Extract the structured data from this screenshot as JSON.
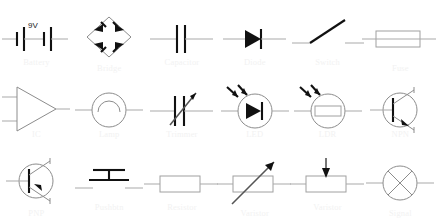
{
  "chart": {
    "type": "reference-grid",
    "columns": 6,
    "rows": 3,
    "label_color": "#f2f2f2",
    "symbol_color": "#111111",
    "lead_color": "#a9a9a9",
    "background": "#ffffff"
  },
  "symbols": [
    {
      "id": "battery",
      "label": "Battery",
      "value": "9V",
      "row": 1,
      "col": 1
    },
    {
      "id": "bridge",
      "label": "Bridge",
      "value": "",
      "row": 1,
      "col": 2
    },
    {
      "id": "capacitor",
      "label": "Capacitor",
      "value": "",
      "row": 1,
      "col": 3
    },
    {
      "id": "diode",
      "label": "Diode",
      "value": "",
      "row": 1,
      "col": 4
    },
    {
      "id": "switch",
      "label": "Switch",
      "value": "",
      "row": 1,
      "col": 5
    },
    {
      "id": "fuse",
      "label": "Fuse",
      "value": "",
      "row": 1,
      "col": 6
    },
    {
      "id": "ic",
      "label": "IC",
      "value": "",
      "row": 2,
      "col": 1
    },
    {
      "id": "lamp",
      "label": "Lamp",
      "value": "",
      "row": 2,
      "col": 2
    },
    {
      "id": "trimmer",
      "label": "Trimmer",
      "value": "",
      "row": 2,
      "col": 3
    },
    {
      "id": "led",
      "label": "LED",
      "value": "",
      "row": 2,
      "col": 4
    },
    {
      "id": "ldr",
      "label": "LDR",
      "value": "",
      "row": 2,
      "col": 5
    },
    {
      "id": "npn",
      "label": "NPN",
      "value": "",
      "row": 2,
      "col": 6
    },
    {
      "id": "pnp",
      "label": "PNP",
      "value": "",
      "row": 3,
      "col": 1
    },
    {
      "id": "pushbutton",
      "label": "Pushbtn",
      "value": "",
      "row": 3,
      "col": 2
    },
    {
      "id": "resistor",
      "label": "Resistor",
      "value": "",
      "row": 3,
      "col": 3
    },
    {
      "id": "varistor",
      "label": "Varistor",
      "value": "",
      "row": 3,
      "col": 4
    },
    {
      "id": "varistor2",
      "label": "Varistor",
      "value": "",
      "row": 3,
      "col": 5
    },
    {
      "id": "signal",
      "label": "Signal",
      "value": "",
      "row": 3,
      "col": 6
    }
  ]
}
